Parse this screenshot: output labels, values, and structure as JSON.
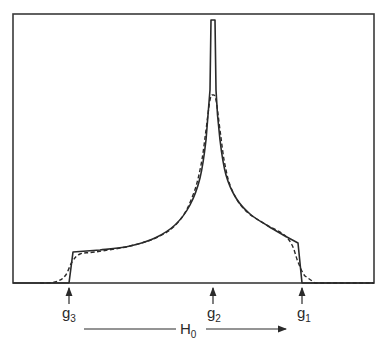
{
  "figure": {
    "type": "powder EPR spectrum sketch (orthorhombic g-tensor absorption)",
    "frame": {
      "x0": 13,
      "y0": 14,
      "x1": 374,
      "y1": 283
    },
    "colors": {
      "line": "#2a2a2a",
      "background": "#ffffff"
    }
  },
  "markers": [
    {
      "id": "g3",
      "label": "g",
      "sub": "3",
      "x": 69
    },
    {
      "id": "g2",
      "label": "g",
      "sub": "2",
      "x": 213
    },
    {
      "id": "g1",
      "label": "g",
      "sub": "1",
      "x": 302
    }
  ],
  "field_axis": {
    "label": "H",
    "sub": "0",
    "direction": "increasing to the right"
  },
  "curves": {
    "solid": {
      "description": "ideal absorption line shape (sharp step edges, singular spike at g2)",
      "points": [
        [
          13,
          283
        ],
        [
          69,
          283
        ],
        [
          73,
          252
        ],
        [
          100,
          250
        ],
        [
          130,
          246
        ],
        [
          155,
          238
        ],
        [
          175,
          225
        ],
        [
          190,
          205
        ],
        [
          200,
          178
        ],
        [
          206,
          140
        ],
        [
          210,
          90
        ],
        [
          211,
          20
        ],
        [
          215,
          20
        ],
        [
          216,
          90
        ],
        [
          220,
          140
        ],
        [
          226,
          175
        ],
        [
          236,
          198
        ],
        [
          250,
          214
        ],
        [
          268,
          226
        ],
        [
          285,
          236
        ],
        [
          298,
          243
        ],
        [
          302,
          283
        ],
        [
          374,
          283
        ]
      ]
    },
    "dashed": {
      "description": "broadened line shape",
      "points": [
        [
          40,
          283
        ],
        [
          55,
          282
        ],
        [
          65,
          276
        ],
        [
          72,
          262
        ],
        [
          80,
          254
        ],
        [
          95,
          252
        ],
        [
          130,
          246
        ],
        [
          160,
          236
        ],
        [
          180,
          220
        ],
        [
          193,
          195
        ],
        [
          201,
          165
        ],
        [
          206,
          130
        ],
        [
          210,
          100
        ],
        [
          213,
          95
        ],
        [
          216,
          100
        ],
        [
          220,
          130
        ],
        [
          225,
          165
        ],
        [
          232,
          190
        ],
        [
          245,
          210
        ],
        [
          265,
          224
        ],
        [
          283,
          234
        ],
        [
          292,
          245
        ],
        [
          298,
          262
        ],
        [
          305,
          276
        ],
        [
          315,
          283
        ],
        [
          374,
          283
        ]
      ]
    }
  }
}
